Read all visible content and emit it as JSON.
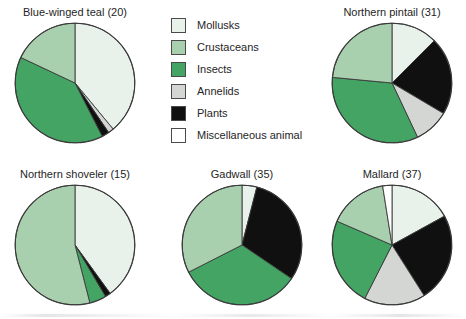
{
  "figure": {
    "kind": "pie-chart-panel",
    "background": "#ffffff"
  },
  "legend": {
    "name": "diet-category-legend",
    "position": "top-center",
    "items": [
      {
        "label": "Mollusks",
        "color": "#e8f2ea",
        "border": "#4a4a4a"
      },
      {
        "label": "Crustaceans",
        "color": "#a8cfae",
        "border": "#4a4a4a"
      },
      {
        "label": "Insects",
        "color": "#43a463",
        "border": "#4a4a4a"
      },
      {
        "label": "Annelids",
        "color": "#d4d6d4",
        "border": "#4a4a4a"
      },
      {
        "label": "Plants",
        "color": "#101010",
        "border": "#4a4a4a"
      },
      {
        "label": "Miscellaneous animal",
        "color": "#ffffff",
        "border": "#4a4a4a"
      }
    ]
  },
  "chart_data": [
    {
      "type": "pie",
      "title": "Blue-winged teal (20)",
      "sample_size": 20,
      "start_angle_deg": 0,
      "direction": "clockwise",
      "categories": [
        "Mollusks",
        "Annelids",
        "Plants",
        "Insects",
        "Crustaceans"
      ],
      "values": [
        39.0,
        1.5,
        2.0,
        39.5,
        18.0
      ],
      "unit": "percent"
    },
    {
      "type": "pie",
      "title": "Northern pintail (31)",
      "sample_size": 31,
      "start_angle_deg": 0,
      "direction": "clockwise",
      "categories": [
        "Mollusks",
        "Plants",
        "Annelids",
        "Insects",
        "Crustaceans"
      ],
      "values": [
        12.5,
        21.0,
        9.5,
        33.5,
        23.5
      ],
      "unit": "percent"
    },
    {
      "type": "pie",
      "title": "Northern shoveler (15)",
      "sample_size": 15,
      "start_angle_deg": 0,
      "direction": "clockwise",
      "categories": [
        "Mollusks",
        "Plants",
        "Insects",
        "Crustaceans"
      ],
      "values": [
        40.0,
        1.5,
        4.5,
        54.0
      ],
      "unit": "percent"
    },
    {
      "type": "pie",
      "title": "Gadwall (35)",
      "sample_size": 35,
      "start_angle_deg": 0,
      "direction": "clockwise",
      "categories": [
        "Mollusks",
        "Plants",
        "Insects",
        "Crustaceans"
      ],
      "values": [
        4.0,
        30.5,
        33.0,
        32.5
      ],
      "unit": "percent"
    },
    {
      "type": "pie",
      "title": "Mallard (37)",
      "sample_size": 37,
      "start_angle_deg": 0,
      "direction": "clockwise",
      "categories": [
        "Mollusks",
        "Plants",
        "Annelids",
        "Insects",
        "Crustaceans",
        "Miscellaneous animal"
      ],
      "values": [
        17.0,
        24.0,
        16.5,
        24.0,
        16.0,
        2.5
      ],
      "unit": "percent"
    }
  ],
  "layout": {
    "pies": [
      {
        "name": "pie-blue-winged-teal",
        "x": 14,
        "y": 6,
        "size": 122
      },
      {
        "name": "pie-northern-pintail",
        "x": 331,
        "y": 6,
        "size": 122
      },
      {
        "name": "pie-northern-shoveler",
        "x": 14,
        "y": 168,
        "size": 122
      },
      {
        "name": "pie-gadwall",
        "x": 181,
        "y": 168,
        "size": 122
      },
      {
        "name": "pie-mallard",
        "x": 331,
        "y": 168,
        "size": 122
      }
    ]
  }
}
